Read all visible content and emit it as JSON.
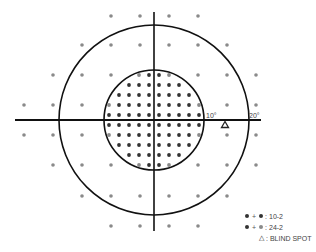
{
  "diagram": {
    "center": {
      "x": 154,
      "y": 120
    },
    "axes": {
      "horizontal": {
        "x1": 15,
        "x2": 261,
        "y": 120
      },
      "vertical": {
        "x": 154,
        "y1": 12,
        "y2": 231
      }
    },
    "circles": [
      {
        "name": "inner-circle-10deg",
        "radius": 50,
        "label": "10°",
        "label_x": 206,
        "label_y": 118
      },
      {
        "name": "outer-circle-20deg",
        "radius": 95,
        "label": "20°",
        "label_x": 249,
        "label_y": 118
      }
    ],
    "colors": {
      "line": "#111111",
      "dot_10_2": "#333333",
      "dot_24_2": "#8a8a8a",
      "blind_spot": "#222222"
    },
    "points_10_2": {
      "spacing_px": 10,
      "rows": [
        {
          "y": 75,
          "xs": [
            139,
            169
          ],
          "shared_xs": [
            139,
            169
          ],
          "dark_xs": [
            149,
            159
          ]
        },
        {
          "y": 85,
          "dark_xs": [
            129,
            139,
            149,
            159,
            169,
            179
          ]
        },
        {
          "y": 95,
          "dark_xs": [
            119,
            129,
            139,
            149,
            159,
            169,
            179,
            189
          ]
        },
        {
          "y": 105,
          "shared_xs": [
            109,
            199
          ],
          "dark_xs": [
            119,
            129,
            139,
            149,
            159,
            169,
            179,
            189
          ]
        },
        {
          "y": 115,
          "dark_xs": [
            109,
            119,
            129,
            139,
            149,
            159,
            169,
            179,
            189,
            199
          ]
        },
        {
          "y": 125,
          "dark_xs": [
            109,
            119,
            129,
            139,
            149,
            159,
            169,
            179,
            189,
            199
          ]
        },
        {
          "y": 135,
          "shared_xs": [
            109,
            199
          ],
          "dark_xs": [
            119,
            129,
            139,
            149,
            159,
            169,
            179,
            189
          ]
        },
        {
          "y": 145,
          "dark_xs": [
            119,
            129,
            139,
            149,
            159,
            169,
            179,
            189
          ]
        },
        {
          "y": 155,
          "dark_xs": [
            129,
            139,
            149,
            159,
            169,
            179
          ]
        },
        {
          "y": 165,
          "shared_xs": [
            139,
            169
          ],
          "dark_xs": [
            149,
            159
          ]
        }
      ]
    },
    "points_24_2": {
      "rows": [
        {
          "y": 16,
          "xs": [
            111,
            140,
            169,
            198
          ]
        },
        {
          "y": 45,
          "xs": [
            82,
            111,
            140,
            169,
            198,
            227
          ]
        },
        {
          "y": 75,
          "xs": [
            53,
            82,
            111,
            198,
            227,
            256
          ]
        },
        {
          "y": 105,
          "xs": [
            24,
            53,
            82,
            227,
            256
          ]
        },
        {
          "y": 135,
          "xs": [
            24,
            53,
            82,
            227,
            256
          ]
        },
        {
          "y": 165,
          "xs": [
            53,
            82,
            111,
            198,
            227,
            256
          ]
        },
        {
          "y": 196,
          "xs": [
            82,
            111,
            140,
            169,
            198,
            227
          ]
        },
        {
          "y": 226,
          "xs": [
            111,
            140,
            169,
            198
          ]
        }
      ]
    },
    "blind_spot": {
      "x": 225,
      "y": 125,
      "symbol": "▲"
    }
  },
  "legend": {
    "items": [
      {
        "label": ": 10-2",
        "dot1": "#333333",
        "dot2": "#333333"
      },
      {
        "label": ": 24-2",
        "dot1": "#333333",
        "dot2": "#8a8a8a"
      },
      {
        "label": ": BLIND SPOT",
        "symbol": "△"
      }
    ],
    "plus": "+"
  }
}
